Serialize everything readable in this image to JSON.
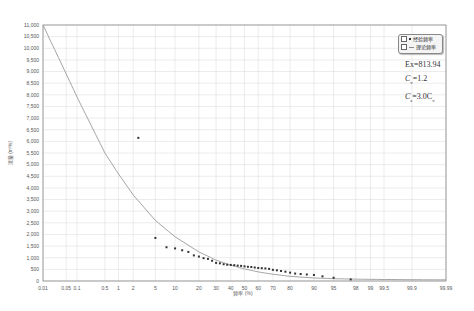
{
  "chart_data": {
    "type": "scatter",
    "title": "",
    "xlabel": "频率 (%)",
    "ylabel": "流量 (m³/s)",
    "x_scale": "probability",
    "x_ticks": [
      "0.01",
      "0.05",
      "0.1",
      "0.5",
      "1",
      "2",
      "5",
      "10",
      "20",
      "30",
      "40",
      "50",
      "60",
      "70",
      "80",
      "90",
      "95",
      "98",
      "99",
      "99.5",
      "99.9",
      "99.99"
    ],
    "y_ticks": [
      "0",
      "500",
      "1,000",
      "1,500",
      "2,000",
      "2,500",
      "3,000",
      "3,500",
      "4,000",
      "4,500",
      "5,000",
      "5,500",
      "6,000",
      "6,500",
      "7,000",
      "7,500",
      "8,000",
      "8,500",
      "9,000",
      "9,500",
      "10,000",
      "10,500",
      "11,000"
    ],
    "ylim": [
      0,
      11000
    ],
    "xlim": [
      0.01,
      99.99
    ],
    "grid": true,
    "legend_position": "top-right",
    "legend": [
      {
        "label": "经验频率",
        "marker": "dot",
        "checked": true
      },
      {
        "label": "理论频率",
        "marker": "line",
        "checked": true
      }
    ],
    "series": [
      {
        "name": "经验频率",
        "type": "scatter",
        "points": [
          [
            2.5,
            6150
          ],
          [
            5.0,
            1850
          ],
          [
            7.5,
            1450
          ],
          [
            10,
            1400
          ],
          [
            12.5,
            1320
          ],
          [
            15,
            1250
          ],
          [
            17.5,
            1100
          ],
          [
            20,
            1050
          ],
          [
            22.5,
            980
          ],
          [
            25,
            950
          ],
          [
            27.5,
            870
          ],
          [
            30,
            780
          ],
          [
            32.5,
            760
          ],
          [
            35,
            720
          ],
          [
            37.5,
            700
          ],
          [
            40,
            690
          ],
          [
            42.5,
            680
          ],
          [
            45,
            660
          ],
          [
            47.5,
            650
          ],
          [
            50,
            630
          ],
          [
            52.5,
            610
          ],
          [
            55,
            600
          ],
          [
            57.5,
            580
          ],
          [
            60,
            560
          ],
          [
            62.5,
            550
          ],
          [
            65,
            540
          ],
          [
            67.5,
            520
          ],
          [
            70,
            480
          ],
          [
            72.5,
            460
          ],
          [
            75,
            430
          ],
          [
            77.5,
            400
          ],
          [
            80,
            360
          ],
          [
            82.5,
            320
          ],
          [
            85,
            300
          ],
          [
            87.5,
            280
          ],
          [
            90,
            260
          ],
          [
            92.5,
            200
          ],
          [
            95,
            140
          ],
          [
            97.5,
            70
          ]
        ]
      },
      {
        "name": "理论频率",
        "type": "line",
        "points": [
          [
            0.01,
            11000
          ],
          [
            0.05,
            8900
          ],
          [
            0.1,
            7900
          ],
          [
            0.5,
            5500
          ],
          [
            1,
            4600
          ],
          [
            2,
            3700
          ],
          [
            5,
            2600
          ],
          [
            10,
            1900
          ],
          [
            20,
            1250
          ],
          [
            30,
            900
          ],
          [
            40,
            680
          ],
          [
            50,
            520
          ],
          [
            60,
            390
          ],
          [
            70,
            290
          ],
          [
            80,
            200
          ],
          [
            90,
            130
          ],
          [
            95,
            100
          ],
          [
            98,
            80
          ],
          [
            99,
            70
          ],
          [
            99.9,
            55
          ],
          [
            99.99,
            50
          ]
        ]
      }
    ],
    "annotations": {
      "ex": "Ex=813.94",
      "cv_label": "C",
      "cv_sub": "v",
      "cv_value": "=1.2",
      "cs_label": "C",
      "cs_sub": "s",
      "cs_value": "=3.0C",
      "cs_value_sub": "v"
    }
  },
  "colors": {
    "grid": "#d8d8d8",
    "frame": "#888888",
    "curve": "#9a9a9a",
    "points": "#333333"
  }
}
